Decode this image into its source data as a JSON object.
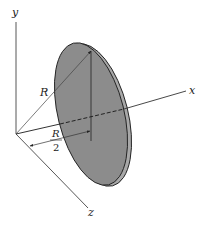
{
  "diagram": {
    "type": "3d-axes-disk",
    "axes": {
      "x_label": "x",
      "y_label": "y",
      "z_label": "z"
    },
    "dimensions": {
      "radius_label": "R",
      "offset_numerator": "R",
      "offset_denominator": "2"
    },
    "colors": {
      "disk_fill": "#8a8a8a",
      "disk_edge": "#a5a5a5",
      "line": "#333333",
      "background": "#ffffff"
    }
  }
}
